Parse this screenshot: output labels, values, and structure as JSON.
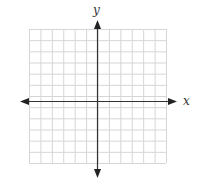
{
  "diagram": {
    "type": "coordinate-grid",
    "x_axis_label": "x",
    "y_axis_label": "y",
    "grid": {
      "columns": 12,
      "rows": 12,
      "units_per_side": 6
    },
    "colors": {
      "grid": "#d9d9d9",
      "axis": "#333333",
      "background": "#ffffff"
    }
  }
}
